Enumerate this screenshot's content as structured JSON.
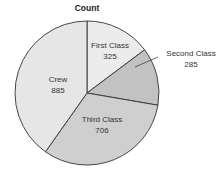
{
  "chart_data": {
    "type": "pie",
    "title": "Count",
    "categories": [
      "First Class",
      "Second Class",
      "Third Class",
      "Crew"
    ],
    "values": [
      325,
      285,
      706,
      885
    ],
    "colors": [
      "#ececec",
      "#c2c2c2",
      "#cfcfcf",
      "#e6e6e6"
    ],
    "start_angle_deg": 0,
    "direction": "clockwise",
    "labels": [
      {
        "name": "First Class",
        "value": "325"
      },
      {
        "name": "Second Class",
        "value": "285"
      },
      {
        "name": "Third Class",
        "value": "706"
      },
      {
        "name": "Crew",
        "value": "885"
      }
    ]
  }
}
